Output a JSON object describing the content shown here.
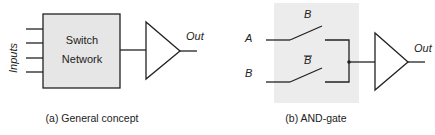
{
  "figure": {
    "panel_a": {
      "block_label_line1": "Switch",
      "block_label_line2": "Network",
      "inputs_label": "Inputs",
      "output_label": "Out",
      "caption": "(a) General concept",
      "input_count": 4
    },
    "panel_b": {
      "input_a_label": "A",
      "input_b_label": "B",
      "switch_top_label": "B",
      "switch_bottom_label": "B",
      "switch_bottom_overbar": true,
      "output_label": "Out",
      "caption": "(b) AND-gate"
    },
    "colors": {
      "block_fill": "#e6e6e6",
      "shade_fill": "#ececec",
      "stroke": "#222222"
    }
  }
}
